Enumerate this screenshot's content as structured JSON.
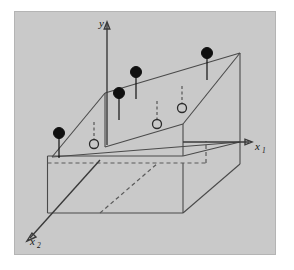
{
  "figure": {
    "background_color": "#c9c9c9",
    "frame_color": "#b4b4b4",
    "line_color": "#4a4a4a",
    "axis_color": "#3a3a3a",
    "filled_point_color": "#101010",
    "open_point_color": "#c9c9c9"
  },
  "axes": [
    {
      "name": "y-axis",
      "label": "y",
      "subscript": "",
      "label_x": 99,
      "label_y": 27
    },
    {
      "name": "x1-axis",
      "label": "x",
      "subscript": "1",
      "label_x": 255,
      "label_y": 150
    },
    {
      "name": "x2-axis",
      "label": "x",
      "subscript": "2",
      "label_x": 30,
      "label_y": 245
    }
  ],
  "observed_points": [
    {
      "id": "obs-1",
      "cx": 59,
      "cy": 133,
      "r": 5.5,
      "stem_to_y": 158
    },
    {
      "id": "obs-2",
      "cx": 119,
      "cy": 93,
      "r": 5.5,
      "stem_to_y": 120
    },
    {
      "id": "obs-3",
      "cx": 136,
      "cy": 72,
      "r": 5.5,
      "stem_to_y": 99
    },
    {
      "id": "obs-4",
      "cx": 207,
      "cy": 53,
      "r": 5.5,
      "stem_to_y": 80
    }
  ],
  "fitted_points": [
    {
      "id": "fit-1",
      "cx": 94,
      "cy": 144,
      "r": 4.5,
      "stem_from_y": 122
    },
    {
      "id": "fit-2",
      "cx": 157,
      "cy": 124,
      "r": 4.5,
      "stem_from_y": 101
    },
    {
      "id": "fit-3",
      "cx": 182,
      "cy": 108,
      "r": 4.5,
      "stem_from_y": 86
    }
  ],
  "plane": {
    "name": "regression-plane",
    "corners": "52,157 105,93 240,53 188,119"
  },
  "counts": {
    "observed": 4,
    "fitted": 3
  }
}
